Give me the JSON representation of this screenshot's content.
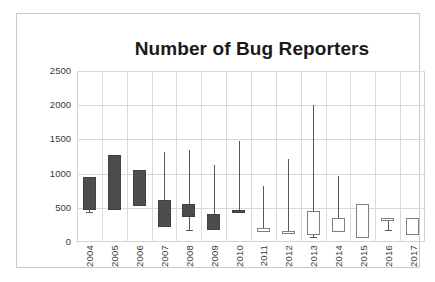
{
  "chart_data": {
    "type": "bar",
    "subtype": "box-plot",
    "title": "Number of Bug Reporters",
    "xlabel": "",
    "ylabel": "",
    "ylim": [
      0,
      2500
    ],
    "yticks": [
      0,
      500,
      1000,
      1500,
      2000,
      2500
    ],
    "ytick_labels": [
      "0",
      "500",
      "1000",
      "1500",
      "2000",
      "2500"
    ],
    "grid": true,
    "legend": "none",
    "categories": [
      "2004",
      "2005",
      "2006",
      "2007",
      "2008",
      "2009",
      "2010",
      "2011",
      "2012",
      "2013",
      "2014",
      "2015",
      "2016",
      "2017"
    ],
    "series": [
      {
        "name": "Bug reporters per year",
        "boxes": [
          {
            "category": "2004",
            "low": 440,
            "q1": 470,
            "q3": 950,
            "high": 950,
            "fill": "dark"
          },
          {
            "category": "2005",
            "low": 470,
            "q1": 470,
            "q3": 1270,
            "high": 1270,
            "fill": "dark"
          },
          {
            "category": "2006",
            "low": 530,
            "q1": 530,
            "q3": 1050,
            "high": 1050,
            "fill": "dark"
          },
          {
            "category": "2007",
            "low": 220,
            "q1": 220,
            "q3": 620,
            "high": 1310,
            "fill": "dark"
          },
          {
            "category": "2008",
            "low": 170,
            "q1": 360,
            "q3": 560,
            "high": 1340,
            "fill": "dark"
          },
          {
            "category": "2009",
            "low": 180,
            "q1": 180,
            "q3": 410,
            "high": 1130,
            "fill": "dark"
          },
          {
            "category": "2010",
            "low": 430,
            "q1": 430,
            "q3": 470,
            "high": 1480,
            "fill": "dark"
          },
          {
            "category": "2011",
            "low": 150,
            "q1": 150,
            "q3": 210,
            "high": 820,
            "fill": "light"
          },
          {
            "category": "2012",
            "low": 140,
            "q1": 140,
            "q3": 155,
            "high": 1210,
            "fill": "light"
          },
          {
            "category": "2013",
            "low": 70,
            "q1": 100,
            "q3": 450,
            "high": 2000,
            "fill": "light"
          },
          {
            "category": "2014",
            "low": 150,
            "q1": 150,
            "q3": 350,
            "high": 960,
            "fill": "light"
          },
          {
            "category": "2015",
            "low": 60,
            "q1": 60,
            "q3": 550,
            "high": 550,
            "fill": "light"
          },
          {
            "category": "2016",
            "low": 170,
            "q1": 300,
            "q3": 350,
            "high": 350,
            "fill": "light"
          },
          {
            "category": "2017",
            "low": 100,
            "q1": 100,
            "q3": 350,
            "high": 350,
            "fill": "light"
          }
        ]
      }
    ],
    "colors": {
      "dark_fill": "#4d4d4d",
      "light_fill": "#ffffff",
      "outline": "#808080",
      "whisker": "#595959",
      "grid": "#d9d9d9",
      "title": "#1a1a1a"
    }
  }
}
